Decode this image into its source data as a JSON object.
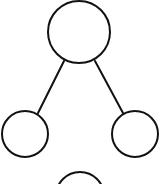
{
  "diagram": {
    "type": "tree",
    "stroke_color": "#111111",
    "fill_color": "#ffffff",
    "background": "#ffffff",
    "stroke_width": 2,
    "nodes": [
      {
        "id": "root",
        "cx": 79,
        "cy": 32,
        "r": 31,
        "label": ""
      },
      {
        "id": "left-child",
        "cx": 25,
        "cy": 134,
        "r": 23,
        "label": ""
      },
      {
        "id": "right-child",
        "cx": 135,
        "cy": 134,
        "r": 23,
        "label": ""
      },
      {
        "id": "bottom-node",
        "cx": 80,
        "cy": 196,
        "r": 24,
        "label": ""
      }
    ],
    "edges": [
      {
        "from": "root",
        "to": "left-child",
        "x1": 64,
        "y1": 61,
        "x2": 38,
        "y2": 113
      },
      {
        "from": "root",
        "to": "right-child",
        "x1": 95,
        "y1": 61,
        "x2": 123,
        "y2": 113
      }
    ]
  }
}
